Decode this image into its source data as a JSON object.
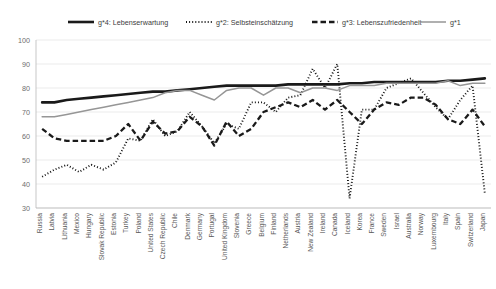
{
  "chart_data": {
    "type": "line",
    "title": "",
    "subtitle": "",
    "xlabel": "",
    "ylabel": "",
    "ylim": [
      30,
      100
    ],
    "ytick_step": 10,
    "yticks": [
      100,
      90,
      80,
      70,
      60,
      50,
      40,
      30
    ],
    "grid": true,
    "legend_position": "top",
    "categories": [
      "Russia",
      "Latvia",
      "Lithuania",
      "Mexico",
      "Hungary",
      "Slovak Republic",
      "Estonia",
      "Turkey",
      "Poland",
      "United States",
      "Czech Republic",
      "Chile",
      "Denmark",
      "Germany",
      "Portugal",
      "United Kingdom",
      "Slovenia",
      "Greece",
      "Belgium",
      "Finland",
      "Netherlands",
      "Austria",
      "New Zealand",
      "Ireland",
      "Canada",
      "Iceland",
      "Korea",
      "France",
      "Sweden",
      "Israel",
      "Australia",
      "Norway",
      "Luxembourg",
      "Italy",
      "Spain",
      "Switzerland",
      "Japan"
    ],
    "series": [
      {
        "name": "g*4: Lebenserwartung",
        "key": "g4",
        "style": "solid-thick",
        "color": "#1a1a1a",
        "width": 2.6,
        "dash": "none",
        "values": [
          74,
          74,
          75,
          75.5,
          76,
          76.5,
          77,
          77.5,
          78,
          78.5,
          78.5,
          79,
          79.5,
          80,
          80.5,
          81,
          81,
          81,
          81,
          81,
          81.5,
          81.5,
          81.5,
          81.5,
          81.5,
          82,
          82,
          82.5,
          82.5,
          82.5,
          82.5,
          82.5,
          82.5,
          83,
          83,
          83.5,
          84
        ]
      },
      {
        "name": "g*2: Selbsteinschätzung",
        "key": "g2",
        "style": "dotted",
        "color": "#141414",
        "width": 1.9,
        "dash": "1,2.1",
        "values": [
          43,
          46,
          48,
          45,
          48,
          46,
          49,
          59,
          58,
          67,
          60,
          62,
          70,
          64,
          57,
          65,
          63,
          74,
          74,
          70,
          76,
          77,
          88,
          80,
          90,
          34,
          71,
          71,
          80,
          82,
          84,
          78,
          72,
          67,
          75,
          81,
          36
        ]
      },
      {
        "name": "g*3: Lebenszufriedenheit",
        "key": "g3",
        "style": "dashed",
        "color": "#1a1a1a",
        "width": 2.3,
        "dash": "5.5,3",
        "values": [
          63,
          59,
          58,
          58,
          58,
          58,
          60,
          65,
          58,
          66,
          61,
          62,
          68,
          64,
          56,
          66,
          60,
          63,
          70,
          72,
          74,
          72,
          75,
          71,
          75,
          70,
          65,
          71,
          74,
          73,
          76,
          76,
          73,
          67,
          65,
          71,
          64
        ]
      },
      {
        "name": "g*1",
        "key": "g1",
        "style": "solid-thin",
        "color": "#969696",
        "width": 1.5,
        "dash": "none",
        "values": [
          68,
          68,
          69,
          70,
          71,
          72,
          73,
          74,
          75,
          76,
          78,
          79,
          79,
          77,
          75,
          79,
          80,
          80,
          77,
          80,
          80,
          78,
          80,
          80,
          79,
          81,
          81,
          81,
          82,
          82,
          82,
          82,
          82,
          83,
          81,
          82,
          82
        ]
      }
    ]
  },
  "legend": {
    "items": [
      {
        "label": "g*4: Lebenserwartung",
        "marker": "solid-thick"
      },
      {
        "label": "g*2: Selbsteinschätzung",
        "marker": "dotted"
      },
      {
        "label": "g*3: Lebenszufriedenheit",
        "marker": "dashed"
      },
      {
        "label": "g*1",
        "marker": "solid-thin"
      }
    ]
  }
}
